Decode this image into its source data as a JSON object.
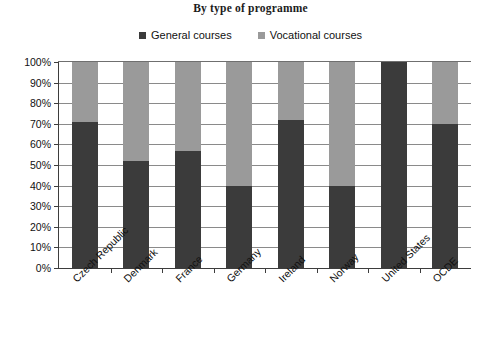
{
  "chart_data": {
    "type": "bar",
    "subtype": "stacked-100-percent",
    "title": "By type of programme",
    "xlabel": "",
    "ylabel": "",
    "ylim": [
      0,
      100
    ],
    "ytick_labels": [
      "100%",
      "90%",
      "80%",
      "70%",
      "60%",
      "50%",
      "40%",
      "30%",
      "20%",
      "10%",
      "0%"
    ],
    "ytick_values": [
      100,
      90,
      80,
      70,
      60,
      50,
      40,
      30,
      20,
      10,
      0
    ],
    "grid": true,
    "legend_position": "top-center",
    "categories": [
      "Czech Republic",
      "Denmark",
      "France",
      "Germany",
      "Ireland",
      "Norway",
      "United States",
      "OCDE"
    ],
    "series": [
      {
        "name": "General courses",
        "color": "#3b3b3b",
        "values": [
          71,
          52,
          57,
          40,
          72,
          40,
          100,
          70
        ]
      },
      {
        "name": "Vocational courses",
        "color": "#9a9a9a",
        "values": [
          29,
          48,
          43,
          60,
          28,
          60,
          0,
          30
        ]
      }
    ]
  },
  "legend": {
    "items": [
      {
        "label": "General courses",
        "swatch": "legend-swatch-dark"
      },
      {
        "label": "Vocational courses",
        "swatch": "legend-swatch-gray"
      }
    ]
  }
}
